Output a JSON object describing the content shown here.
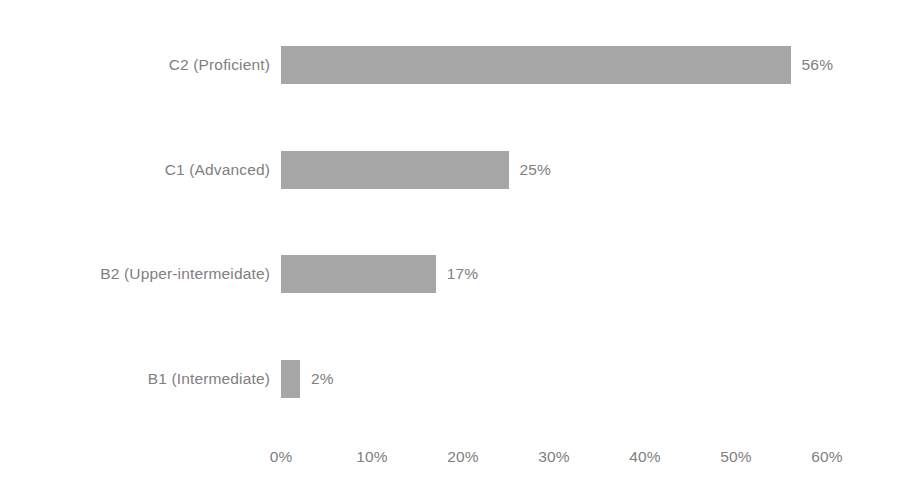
{
  "chart_data": {
    "type": "bar",
    "orientation": "horizontal",
    "title": "",
    "subtitle": "",
    "xlabel": "",
    "ylabel": "",
    "categories": [
      "C2 (Proficient)",
      "C1 (Advanced)",
      "B2 (Upper-intermeidate)",
      "B1 (Intermediate)"
    ],
    "values": [
      56,
      25,
      17,
      2
    ],
    "value_labels": [
      "56%",
      "25%",
      "17%",
      "2%"
    ],
    "xlim": [
      0,
      60
    ],
    "xticks": [
      0,
      10,
      20,
      30,
      40,
      50,
      60
    ],
    "xtick_labels": [
      "0%",
      "10%",
      "20%",
      "30%",
      "40%",
      "50%",
      "60%"
    ],
    "grid": false,
    "legend": false,
    "legend_position": "none",
    "bar_color": "#a6a6a6",
    "text_color": "#808080",
    "background_color": "#ffffff",
    "units": "percent"
  },
  "bars": [
    {
      "label": "C2 (Proficient)",
      "value": 56,
      "value_label": "56%"
    },
    {
      "label": "C1 (Advanced)",
      "value": 25,
      "value_label": "25%"
    },
    {
      "label": "B2 (Upper-intermeidate)",
      "value": 17,
      "value_label": "17%"
    },
    {
      "label": "B1 (Intermediate)",
      "value": 2,
      "value_label": "2%"
    }
  ],
  "axis": {
    "ticks": [
      {
        "label": "0%",
        "value": 0
      },
      {
        "label": "10%",
        "value": 10
      },
      {
        "label": "20%",
        "value": 20
      },
      {
        "label": "30%",
        "value": 30
      },
      {
        "label": "40%",
        "value": 40
      },
      {
        "label": "50%",
        "value": 50
      },
      {
        "label": "60%",
        "value": 60
      }
    ]
  },
  "geometry": {
    "origin_x": 281,
    "px_per_unit": 9.1,
    "row_start_y": 46,
    "row_pitch": 104.5,
    "bar_height": 38,
    "min_bar_width": 19
  }
}
